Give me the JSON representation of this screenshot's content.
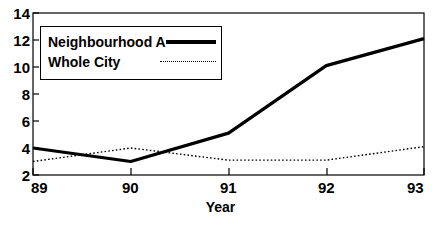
{
  "chart_data": {
    "type": "line",
    "title": "",
    "xlabel": "Year",
    "ylabel": "",
    "x": [
      "89",
      "90",
      "91",
      "92",
      "93"
    ],
    "categories": [
      "89",
      "90",
      "91",
      "92",
      "93"
    ],
    "xlim": [
      89,
      93
    ],
    "ylim": [
      2,
      14
    ],
    "yticks": [
      2,
      4,
      6,
      8,
      10,
      12,
      14
    ],
    "xticks": [
      "89",
      "90",
      "91",
      "92",
      "93"
    ],
    "grid": false,
    "legend_position": "top-left",
    "series": [
      {
        "name": "Neighbourhood A",
        "style": "solid-thick",
        "values": [
          4.0,
          3.0,
          5.1,
          10.1,
          12.1
        ]
      },
      {
        "name": "Whole City",
        "style": "dotted-thin",
        "values": [
          3.0,
          4.0,
          3.1,
          3.1,
          4.1
        ]
      }
    ]
  },
  "axes": {
    "y_tick_labels": [
      "14",
      "12",
      "10",
      "8",
      "6",
      "4",
      "2"
    ],
    "x_tick_labels": [
      "89",
      "90",
      "91",
      "92",
      "93"
    ],
    "x_axis_title": "Year"
  },
  "legend": {
    "entries": [
      {
        "label": "Neighbourhood A",
        "marker": "solid-line-swatch"
      },
      {
        "label": "Whole City",
        "marker": "dotted-line-swatch"
      }
    ]
  },
  "colors": {
    "line": "#000000",
    "axis": "#000000",
    "background": "#ffffff"
  }
}
